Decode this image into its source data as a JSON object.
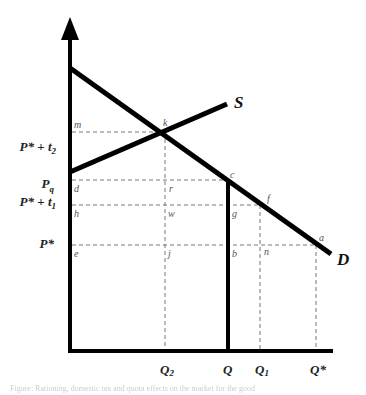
{
  "figure": {
    "type": "supply-demand-diagram",
    "y_axis_labels": {
      "p_star_t2": {
        "base": "P*",
        "op": " + ",
        "var": "t",
        "sub": "2"
      },
      "p_q": {
        "base": "P",
        "sub": "q"
      },
      "p_star_t1": {
        "base": "P*",
        "op": " + ",
        "var": "t",
        "sub": "1"
      },
      "p_star": {
        "base": "P*"
      }
    },
    "x_axis_labels": {
      "q2": {
        "base": "Q",
        "sub": "2"
      },
      "q": {
        "base": "Q"
      },
      "q1": {
        "base": "Q",
        "sub": "1"
      },
      "q_star": {
        "base": "Q*"
      }
    },
    "curves": {
      "supply": "S",
      "demand": "D"
    },
    "points": {
      "m": "m",
      "k": "k",
      "d": "d",
      "r": "r",
      "c": "c",
      "h": "h",
      "w": "w",
      "g": "g",
      "f": "f",
      "e": "e",
      "j": "j",
      "b": "b",
      "n": "n",
      "a": "a"
    },
    "colors": {
      "lines": "#000000",
      "dashes": "#777777",
      "background": "#ffffff"
    }
  },
  "caption": "Figure: Rationing, domestic tax and quota effects on the market for the good"
}
